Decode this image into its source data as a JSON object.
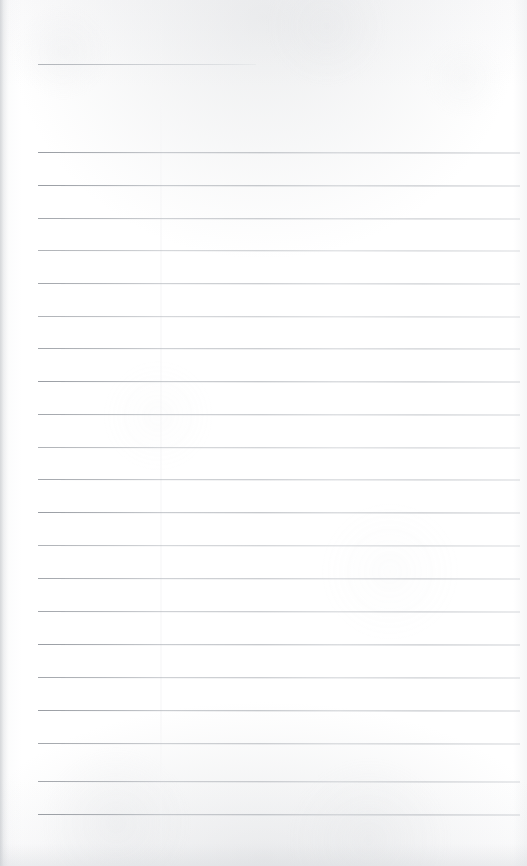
{
  "document": {
    "kind": "lined-paper-scan",
    "title": "Blank ruled notebook page",
    "description": "A scanned blank sheet of ruled writing paper. No handwriting, no printed text, no page number — only horizontal rule lines on an off-white background.",
    "visible_text": "",
    "page_width_px": 527,
    "page_height_px": 866,
    "background_color": "#ffffff",
    "rule_color": "#9ca0a6",
    "rule_color_faded": "#bec2c8",
    "paper_tint": "#f7f7f8"
  },
  "ruling": {
    "short_rule": {
      "label": "header-rule",
      "y": 64,
      "x_start": 38,
      "x_end": 256,
      "width": 218,
      "tone": "mid"
    },
    "body_rule_count": 21,
    "body_x_start": 38,
    "body_x_end": 520,
    "body_width": 482,
    "spacing_px": 33,
    "first_body_y": 152,
    "last_body_y": 814,
    "body_rules": [
      {
        "y": 152,
        "tone": "dark"
      },
      {
        "y": 185,
        "tone": "dark"
      },
      {
        "y": 218,
        "tone": "mid"
      },
      {
        "y": 250,
        "tone": "light"
      },
      {
        "y": 283,
        "tone": "mid"
      },
      {
        "y": 316,
        "tone": "light"
      },
      {
        "y": 348,
        "tone": "mid"
      },
      {
        "y": 381,
        "tone": "dark"
      },
      {
        "y": 414,
        "tone": "mid"
      },
      {
        "y": 447,
        "tone": "light"
      },
      {
        "y": 479,
        "tone": "mid"
      },
      {
        "y": 512,
        "tone": "dark"
      },
      {
        "y": 545,
        "tone": "light"
      },
      {
        "y": 578,
        "tone": "mid"
      },
      {
        "y": 611,
        "tone": "mid"
      },
      {
        "y": 644,
        "tone": "dark"
      },
      {
        "y": 677,
        "tone": "mid"
      },
      {
        "y": 710,
        "tone": "dark"
      },
      {
        "y": 743,
        "tone": "mid"
      },
      {
        "y": 781,
        "tone": "mid"
      },
      {
        "y": 814,
        "tone": "dark"
      }
    ]
  },
  "artifacts": {
    "scan_seam_x": 160,
    "left_edge_shadow": true,
    "bottom_edge_shadow": true
  }
}
